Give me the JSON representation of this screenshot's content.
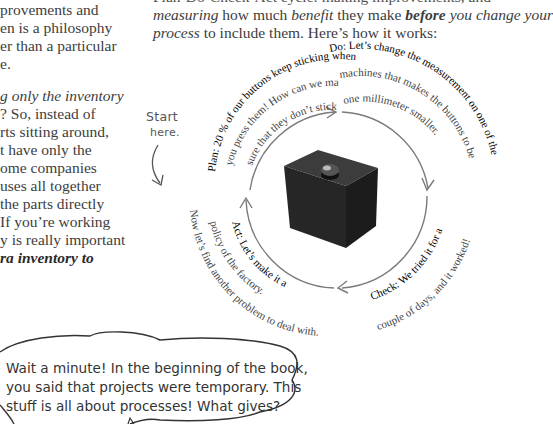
{
  "left_column": {
    "lines": [
      {
        "text": "provements and",
        "style": "normal"
      },
      {
        "text": "en is a philosophy",
        "style": "normal"
      },
      {
        "text": "er than a particular",
        "style": "normal"
      },
      {
        "text": "e.",
        "style": "normal"
      },
      {
        "text": "g only the inventory",
        "style": "italic"
      },
      {
        "text": "? So, instead of",
        "style": "normal"
      },
      {
        "text": "rts sitting around,",
        "style": "normal"
      },
      {
        "text": "t have only the",
        "style": "normal"
      },
      {
        "text": "ome companies",
        "style": "normal"
      },
      {
        "text": "uses all together",
        "style": "normal"
      },
      {
        "text": " the parts directly",
        "style": "normal"
      },
      {
        "text": "If you’re working",
        "style": "normal"
      },
      {
        "text": "y is really important",
        "style": "normal"
      },
      {
        "text": "ra inventory to",
        "style": "bold-italic"
      }
    ]
  },
  "intro": {
    "line1_partial": "Plan-Do-Check-Act cycle: making improvements, and",
    "line2": {
      "a": "measuring",
      "b": " how much ",
      "c": "benefit",
      "d": " they make ",
      "e": "before",
      "f": " you change your"
    },
    "line3": {
      "a": "process",
      "b": " to include them. Here’s how it works:"
    }
  },
  "cycle": {
    "start_label_1": "Start",
    "start_label_2": "here.",
    "plan": {
      "label": "Plan:",
      "line1": " 20 % of our buttons keep sticking when",
      "line2": "you press them! How can we make",
      "line3": "sure that they don’t stick?"
    },
    "do": {
      "label": "Do:",
      "line1": " Let’s change the measurement on one of the",
      "line2": "machines that makes the buttons to be",
      "line3": "one millimeter smaller."
    },
    "check": {
      "label": "Check:",
      "line1": " We tried it for a",
      "line2": "couple of days, and it worked!"
    },
    "act": {
      "label": "Act:",
      "line1": " Let’s make it a",
      "line2": "policy of the factory.",
      "line3": "Now let’s find another problem to deal with."
    },
    "image": "black-button-cube",
    "colors": {
      "arrow": "#777777",
      "cube": "#2e2e2e"
    }
  },
  "speech_bubble": {
    "line1": "Wait a minute! In the beginning of the book,",
    "line2": "you said that projects were temporary. This",
    "line3": "stuff is all about processes! What gives?"
  }
}
